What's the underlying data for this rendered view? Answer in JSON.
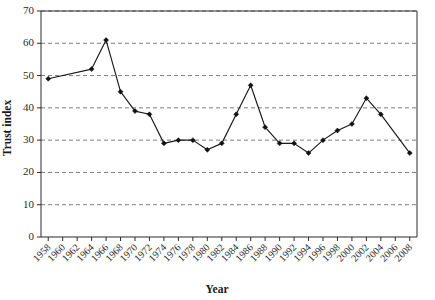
{
  "chart_data": {
    "type": "line",
    "title": "",
    "xlabel": "Year",
    "ylabel": "Trust index",
    "xlim": [
      1957,
      2009
    ],
    "ylim": [
      0,
      70
    ],
    "ytick_step": 10,
    "yticks": [
      0,
      10,
      20,
      30,
      40,
      50,
      60,
      70
    ],
    "grid": "horizontal-dashed",
    "legend": "none",
    "marker": "filled-diamond",
    "categories": [
      1958,
      1964,
      1966,
      1968,
      1970,
      1972,
      1974,
      1976,
      1978,
      1980,
      1982,
      1984,
      1986,
      1988,
      1990,
      1992,
      1994,
      1996,
      1998,
      2000,
      2002,
      2004,
      2008
    ],
    "values": [
      49,
      52,
      61,
      45,
      39,
      38,
      29,
      30,
      30,
      27,
      29,
      38,
      47,
      34,
      29,
      29,
      26,
      30,
      33,
      35,
      43,
      38,
      26
    ],
    "points": [
      {
        "x": 1958,
        "y": 49
      },
      {
        "x": 1964,
        "y": 52
      },
      {
        "x": 1966,
        "y": 61
      },
      {
        "x": 1968,
        "y": 45
      },
      {
        "x": 1970,
        "y": 39
      },
      {
        "x": 1972,
        "y": 38
      },
      {
        "x": 1974,
        "y": 29
      },
      {
        "x": 1976,
        "y": 30
      },
      {
        "x": 1978,
        "y": 30
      },
      {
        "x": 1980,
        "y": 27
      },
      {
        "x": 1982,
        "y": 29
      },
      {
        "x": 1984,
        "y": 38
      },
      {
        "x": 1986,
        "y": 47
      },
      {
        "x": 1988,
        "y": 34
      },
      {
        "x": 1990,
        "y": 29
      },
      {
        "x": 1992,
        "y": 29
      },
      {
        "x": 1994,
        "y": 26
      },
      {
        "x": 1996,
        "y": 30
      },
      {
        "x": 1998,
        "y": 33
      },
      {
        "x": 2000,
        "y": 35
      },
      {
        "x": 2002,
        "y": 43
      },
      {
        "x": 2004,
        "y": 38
      },
      {
        "x": 2008,
        "y": 26
      }
    ],
    "xtick_labels": [
      "1958",
      "1960",
      "1962",
      "1964",
      "1966",
      "1968",
      "1970",
      "1972",
      "1974",
      "1976",
      "1978",
      "1980",
      "1982",
      "1984",
      "1986",
      "1988",
      "1990",
      "1992",
      "1994",
      "1996",
      "1998",
      "2000",
      "2002",
      "2004",
      "2006",
      "2008"
    ],
    "ytick_labels": [
      "0",
      "10",
      "20",
      "30",
      "40",
      "50",
      "60",
      "70"
    ],
    "series_color": "#111111",
    "grid_color": "#6f6f6f",
    "axis_color": "#2b2b2b"
  }
}
